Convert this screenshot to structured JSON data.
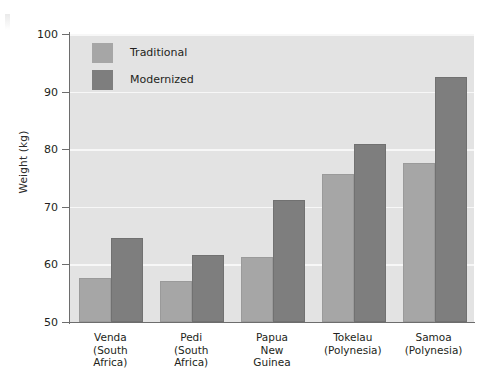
{
  "chart_data": {
    "type": "bar",
    "title": "",
    "xlabel": "",
    "ylabel": "Weight (kg)",
    "ylim": [
      50,
      100
    ],
    "yticks": [
      50,
      60,
      70,
      80,
      90,
      100
    ],
    "ytick_labels": [
      "50",
      "60",
      "70",
      "80",
      "90",
      "100"
    ],
    "grid": true,
    "grid_axis": "y",
    "legend_position": "upper-left-inside",
    "categories": [
      "Venda (South Africa)",
      "Pedi (South Africa)",
      "Papua New Guinea",
      "Tokelau (Polynesia)",
      "Samoa (Polynesia)"
    ],
    "category_lines": [
      [
        "Venda",
        "(South",
        "Africa)"
      ],
      [
        "Pedi",
        "(South",
        "Africa)"
      ],
      [
        "Papua",
        "New",
        "Guinea"
      ],
      [
        "Tokelau",
        "(Polynesia)"
      ],
      [
        "Samoa",
        "(Polynesia)"
      ]
    ],
    "series": [
      {
        "name": "Traditional",
        "color": "#a6a6a6",
        "values": [
          57.3,
          56.7,
          61.0,
          75.4,
          77.2
        ]
      },
      {
        "name": "Modernized",
        "color": "#7e7e7e",
        "values": [
          64.3,
          61.3,
          70.8,
          80.5,
          92.2
        ]
      }
    ],
    "plot_background": "#e3e3e3",
    "gridline_color": "#f7f7f7",
    "axis_color": "#6d6d6d"
  },
  "legend": {
    "items": [
      {
        "label": "Traditional"
      },
      {
        "label": "Modernized"
      }
    ]
  }
}
